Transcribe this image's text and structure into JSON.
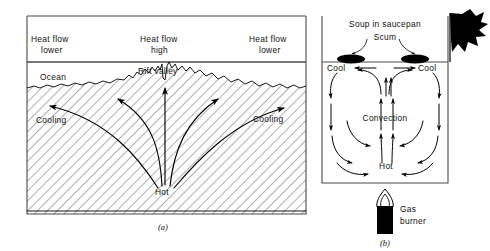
{
  "figure": {
    "panels": [
      {
        "id": "a",
        "caption": "(a)",
        "name": "seafloor-spreading-panel",
        "labels": {
          "heat_flow_left_line1": "Heat flow",
          "heat_flow_left_line2": "lower",
          "heat_flow_center_line1": "Heat flow",
          "heat_flow_center_line2": "high",
          "heat_flow_right_line1": "Heat flow",
          "heat_flow_right_line2": "lower",
          "ocean": "Ocean",
          "rift_valley": "Rift valley",
          "cooling_left": "Cooling",
          "cooling_right": "Cooling",
          "hot": "Hot"
        }
      },
      {
        "id": "b",
        "caption": "(b)",
        "name": "saucepan-panel",
        "labels": {
          "title": "Soup in saucepan",
          "scum": "Scum",
          "cool_left": "Cool",
          "cool_right": "Cool",
          "convection": "Convection",
          "hot": "Hot",
          "gas_burner_line1": "Gas",
          "gas_burner_line2": "burner"
        }
      }
    ],
    "colors": {
      "ink": "#000000",
      "frame": "#4a4a4a",
      "hatch": "#2a2a2a",
      "background": "#ffffff"
    }
  }
}
